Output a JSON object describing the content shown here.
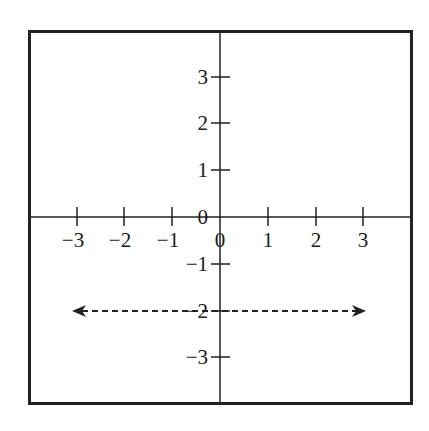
{
  "diagram": {
    "type": "coordinate-plane",
    "frame": {
      "x": 28,
      "y": 30,
      "width": 384,
      "height": 374,
      "stroke": "#222222"
    },
    "axes": {
      "origin_px": {
        "x": 220,
        "y": 217
      },
      "x_ticks": [
        {
          "value": -3,
          "label": "−3",
          "px": 77
        },
        {
          "value": -2,
          "label": "−2",
          "px": 124
        },
        {
          "value": -1,
          "label": "−1",
          "px": 172
        },
        {
          "value": 0,
          "label": "0",
          "px": 220
        },
        {
          "value": 1,
          "label": "1",
          "px": 268
        },
        {
          "value": 2,
          "label": "2",
          "px": 316
        },
        {
          "value": 3,
          "label": "3",
          "px": 363
        }
      ],
      "y_ticks": [
        {
          "value": 3,
          "label": "3",
          "px": 77
        },
        {
          "value": 2,
          "label": "2",
          "px": 123
        },
        {
          "value": 1,
          "label": "1",
          "px": 170
        },
        {
          "value": 0,
          "label": "0",
          "px": 217
        },
        {
          "value": -1,
          "label": "−1",
          "px": 264
        },
        {
          "value": -2,
          "label": "−2",
          "px": 311
        },
        {
          "value": -3,
          "label": "−3",
          "px": 357
        }
      ]
    },
    "graph": {
      "description": "Dashed horizontal line y = -2 with arrows at both ends",
      "equation": "y = -2",
      "y_value": -2,
      "style": "dashed",
      "arrows": "both",
      "x_start_px": 74,
      "x_end_px": 364
    }
  },
  "chart_data": {
    "type": "line",
    "title": "",
    "xlabel": "",
    "ylabel": "",
    "x_ticks": [
      -3,
      -2,
      -1,
      0,
      1,
      2,
      3
    ],
    "y_ticks": [
      -3,
      -2,
      -1,
      0,
      1,
      2,
      3
    ],
    "series": [
      {
        "name": "y = -2",
        "x": [
          -3,
          3
        ],
        "y": [
          -2,
          -2
        ],
        "style": "dashed",
        "arrows": "both"
      }
    ],
    "xlim": [
      -3.3,
      4
    ],
    "ylim": [
      -4,
      4
    ],
    "grid": false
  }
}
